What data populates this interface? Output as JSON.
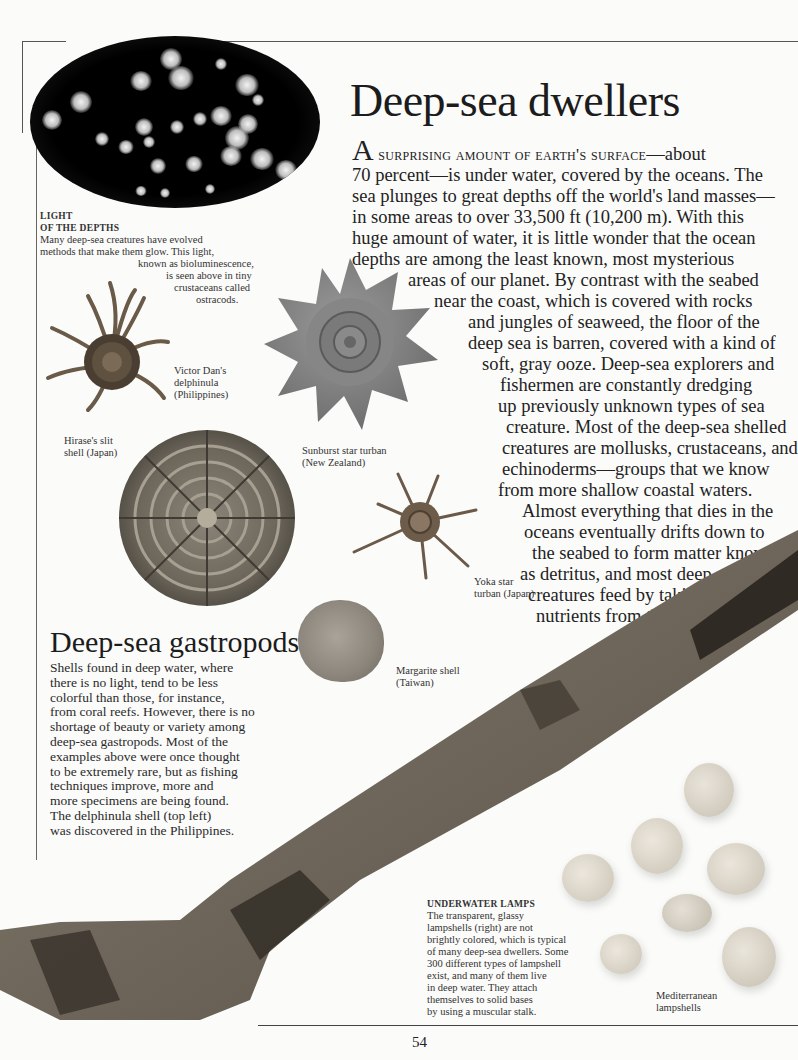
{
  "page": {
    "title": "Deep-sea dwellers",
    "page_number": "54"
  },
  "intro": {
    "drop_cap": "A",
    "lead_small_caps": " surprising amount of earth's surface",
    "lines": [
      "—about",
      "70 percent—is under water, covered by the oceans. The",
      "sea plunges to great depths off the world's land masses—",
      "in some areas to over 33,500 ft (10,200 m). With this",
      "huge amount of water, it is little wonder that the ocean",
      "depths are among the least known, most mysterious",
      "areas of our planet. By contrast with the seabed",
      "near the coast, which is covered with rocks",
      "and jungles of seaweed, the floor of the",
      "deep sea is barren, covered with a kind of",
      "soft, gray ooze. Deep-sea explorers and",
      "fishermen are constantly dredging",
      "up previously unknown types of sea",
      "creature. Most of the deep-sea shelled",
      "creatures are mollusks, crustaceans, and",
      "echinoderms—groups that we know",
      "from more shallow coastal waters.",
      "Almost everything that dies in the",
      "oceans eventually drifts down to",
      "the seabed to form matter known",
      "as detritus, and most deep-sea",
      "creatures feed by taking",
      "nutrients from this."
    ]
  },
  "light_caption": {
    "heading_1": "LIGHT",
    "heading_2": "OF THE DEPTHS",
    "lines": [
      "Many deep-sea creatures have evolved",
      "methods that make them glow. This light,",
      "known as bioluminescence,",
      "is seen above in tiny",
      "crustaceans called",
      "ostracods."
    ]
  },
  "labels": {
    "victor_dan": [
      "Victor Dan's",
      "delphinula",
      "(Philippines)"
    ],
    "hirase": [
      "Hirase's slit",
      "shell (Japan)"
    ],
    "sunburst": [
      "Sunburst star turban",
      "(New Zealand)"
    ],
    "yoka": [
      "Yoka star",
      "turban (Japan)"
    ],
    "margarite": [
      "Margarite shell",
      "(Taiwan)"
    ],
    "lampshells": [
      "Mediterranean",
      "lampshells"
    ]
  },
  "gastropods": {
    "heading": "Deep-sea gastropods",
    "lines": [
      "Shells found in deep water, where",
      "there is no light, tend to be less",
      "colorful than those, for instance,",
      "from coral reefs. However, there is no",
      "shortage of beauty or variety among",
      "deep-sea gastropods. Most of the",
      "examples above were once thought",
      "to be extremely rare, but as fishing",
      "techniques improve, more and",
      "more specimens are being found.",
      "The delphinula shell (top left)",
      "was discovered in the Philippines."
    ]
  },
  "lamps_caption": {
    "heading": "UNDERWATER LAMPS",
    "lines": [
      "The transparent, glassy",
      "lampshells (right) are not",
      "brightly colored, which is typical",
      "of many deep-sea dwellers. Some",
      "300 different types of lampshell",
      "exist, and many of them live",
      "in deep water. They attach",
      "themselves to solid bases",
      "by using a muscular stalk."
    ]
  }
}
